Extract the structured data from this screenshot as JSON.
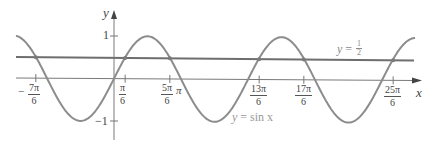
{
  "figure": {
    "axes": {
      "x_label": "x",
      "y_label": "y"
    },
    "y_ticks": [
      {
        "label": "1",
        "value": 1
      },
      {
        "label": "−1",
        "value": -1
      }
    ],
    "x_ticks": [
      {
        "num": "7π",
        "den": "6",
        "sign": "−",
        "value_over_pi": -1.1667
      },
      {
        "num": "π",
        "den": "6",
        "sign": "",
        "value_over_pi": 0.1667
      },
      {
        "num": "5π",
        "den": "6",
        "sign": "",
        "value_over_pi": 0.8333
      },
      {
        "num": "13π",
        "den": "6",
        "sign": "",
        "value_over_pi": 2.1667
      },
      {
        "num": "17π",
        "den": "6",
        "sign": "",
        "value_over_pi": 2.8333
      },
      {
        "num": "25π",
        "den": "6",
        "sign": "",
        "value_over_pi": 4.1667
      }
    ],
    "pi_label": "π",
    "curves": {
      "sine_label": {
        "lhs": "y",
        "eq": " = ",
        "rhs": "sin x"
      },
      "half_label": {
        "lhs": "y",
        "eq": " = ",
        "num": "1",
        "den": "2"
      }
    },
    "colors": {
      "sine": "#8c8c8c",
      "half_line": "#6e6e6e",
      "axes": "#777777",
      "text": "#444444"
    }
  },
  "chart_data": {
    "type": "line",
    "title": "",
    "xlabel": "x",
    "ylabel": "y",
    "ylim": [
      -1,
      1
    ],
    "xlim_over_pi": [
      -1.45,
      4.35
    ],
    "grid": false,
    "series": [
      {
        "name": "y = sin x",
        "function": "sin(x)"
      },
      {
        "name": "y = 1/2",
        "function": "0.5"
      }
    ],
    "intersections_over_pi": [
      -1.1667,
      0.1667,
      0.8333,
      2.1667,
      2.8333,
      4.1667
    ],
    "x_tick_labels": [
      "−7π/6",
      "π/6",
      "5π/6",
      "π",
      "13π/6",
      "17π/6",
      "25π/6"
    ],
    "y_tick_labels": [
      "1",
      "−1"
    ]
  }
}
